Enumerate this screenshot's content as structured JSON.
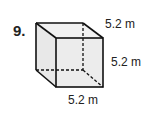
{
  "problem": {
    "number": "9.",
    "shape": "cube",
    "labels": {
      "top_depth": "5.2 m",
      "right_height": "5.2 m",
      "bottom_width": "5.2 m"
    },
    "colors": {
      "edge": "#111111",
      "face_fill": "#ececec"
    }
  }
}
